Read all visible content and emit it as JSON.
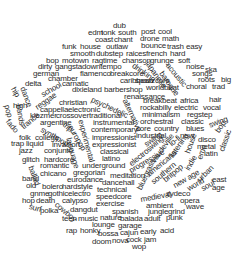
{
  "cloud": {
    "title": "music genre word cloud",
    "words": [
      {
        "t": "dub",
        "x": 113,
        "y": 22,
        "r": 0
      },
      {
        "t": "edm",
        "x": 88,
        "y": 29,
        "r": 0
      },
      {
        "t": "tonk",
        "x": 101,
        "y": 29,
        "r": 0
      },
      {
        "t": "south",
        "x": 118,
        "y": 29,
        "r": 0
      },
      {
        "t": "post",
        "x": 141,
        "y": 28,
        "r": 0
      },
      {
        "t": "cool",
        "x": 158,
        "y": 28,
        "r": 0
      },
      {
        "t": "coast",
        "x": 95,
        "y": 36,
        "r": 0
      },
      {
        "t": "chant",
        "x": 114,
        "y": 36,
        "r": 0
      },
      {
        "t": "drone",
        "x": 140,
        "y": 35,
        "r": 0
      },
      {
        "t": "math",
        "x": 162,
        "y": 35,
        "r": 0
      },
      {
        "t": "funk",
        "x": 62,
        "y": 43,
        "r": 0
      },
      {
        "t": "house",
        "x": 80,
        "y": 43,
        "r": 0
      },
      {
        "t": "outlaw",
        "x": 106,
        "y": 43,
        "r": 0
      },
      {
        "t": "bounce",
        "x": 141,
        "y": 42,
        "r": 0
      },
      {
        "t": "trash",
        "x": 167,
        "y": 43,
        "r": 0
      },
      {
        "t": "easy",
        "x": 186,
        "y": 43,
        "r": 0
      },
      {
        "t": "smooth",
        "x": 70,
        "y": 50,
        "r": 0
      },
      {
        "t": "dubstep",
        "x": 96,
        "y": 50,
        "r": 0
      },
      {
        "t": "raices",
        "x": 126,
        "y": 50,
        "r": 0
      },
      {
        "t": "french",
        "x": 146,
        "y": 50,
        "r": 0
      },
      {
        "t": "hard",
        "x": 170,
        "y": 50,
        "r": 0
      },
      {
        "t": "bop",
        "x": 46,
        "y": 57,
        "r": 0
      },
      {
        "t": "motown",
        "x": 62,
        "y": 57,
        "r": 0
      },
      {
        "t": "ragtime",
        "x": 92,
        "y": 57,
        "r": 0
      },
      {
        "t": "chanson",
        "x": 122,
        "y": 57,
        "r": 0
      },
      {
        "t": "grunge",
        "x": 150,
        "y": 57,
        "r": 0
      },
      {
        "t": "soft",
        "x": 178,
        "y": 57,
        "r": 0
      },
      {
        "t": "dirty",
        "x": 38,
        "y": 63,
        "r": 0
      },
      {
        "t": "gangsta",
        "x": 55,
        "y": 63,
        "r": 0
      },
      {
        "t": "downtempo",
        "x": 82,
        "y": 63,
        "r": 0
      },
      {
        "t": "drinking",
        "x": 135,
        "y": 62,
        "r": 35
      },
      {
        "t": "japanese",
        "x": 150,
        "y": 60,
        "r": 55
      },
      {
        "t": "noise",
        "x": 186,
        "y": 63,
        "r": 0
      },
      {
        "t": "ska",
        "x": 205,
        "y": 66,
        "r": 0
      },
      {
        "t": "german",
        "x": 33,
        "y": 70,
        "r": 0
      },
      {
        "t": "flamenco",
        "x": 80,
        "y": 70,
        "r": 0
      },
      {
        "t": "breakcore",
        "x": 110,
        "y": 70,
        "r": 0
      },
      {
        "t": "acoustic",
        "x": 170,
        "y": 62,
        "r": 50
      },
      {
        "t": "songs",
        "x": 192,
        "y": 70,
        "r": 0
      },
      {
        "t": "chamber",
        "x": 48,
        "y": 75,
        "r": 0
      },
      {
        "t": "caribbean",
        "x": 120,
        "y": 77,
        "r": 0
      },
      {
        "t": "baroque",
        "x": 164,
        "y": 70,
        "r": 55
      },
      {
        "t": "roots",
        "x": 198,
        "y": 76,
        "r": 0
      },
      {
        "t": "big",
        "x": 221,
        "y": 76,
        "r": 0
      },
      {
        "t": "delta",
        "x": 25,
        "y": 80,
        "r": 0
      },
      {
        "t": "carnatic",
        "x": 62,
        "y": 80,
        "r": 0
      },
      {
        "t": "spazzcore",
        "x": 135,
        "y": 77,
        "r": 0
      },
      {
        "t": "school",
        "x": 40,
        "y": 92,
        "r": -30
      },
      {
        "t": "dixieland",
        "x": 72,
        "y": 86,
        "r": 0
      },
      {
        "t": "barbershop",
        "x": 104,
        "y": 86,
        "r": 0
      },
      {
        "t": "worldbeat",
        "x": 146,
        "y": 84,
        "r": 0
      },
      {
        "t": "choral",
        "x": 186,
        "y": 83,
        "r": 0
      },
      {
        "t": "trad",
        "x": 212,
        "y": 83,
        "r": 0
      },
      {
        "t": "renaissance",
        "x": 124,
        "y": 93,
        "r": 0
      },
      {
        "t": "breakbeat",
        "x": 143,
        "y": 97,
        "r": 0
      },
      {
        "t": "africa",
        "x": 180,
        "y": 97,
        "r": 0
      },
      {
        "t": "hair",
        "x": 209,
        "y": 96,
        "r": 0
      },
      {
        "t": "hip",
        "x": 16,
        "y": 86,
        "r": 60
      },
      {
        "t": "dance",
        "x": 26,
        "y": 86,
        "r": 70
      },
      {
        "t": "high",
        "x": 13,
        "y": 102,
        "r": 0
      },
      {
        "t": "reggae",
        "x": 34,
        "y": 105,
        "r": -35
      },
      {
        "t": "christian",
        "x": 59,
        "y": 99,
        "r": 0
      },
      {
        "t": "psychedelic",
        "x": 93,
        "y": 96,
        "r": 25
      },
      {
        "t": "rockabilly",
        "x": 140,
        "y": 104,
        "r": 0
      },
      {
        "t": "electric",
        "x": 174,
        "y": 104,
        "r": 0
      },
      {
        "t": "vocal",
        "x": 203,
        "y": 104,
        "r": 0
      },
      {
        "t": "pop",
        "x": 10,
        "y": 104,
        "r": 75
      },
      {
        "t": "bands",
        "x": 22,
        "y": 104,
        "r": 80
      },
      {
        "t": "cappella",
        "x": 40,
        "y": 106,
        "r": 0
      },
      {
        "t": "electronic",
        "x": 68,
        "y": 106,
        "r": 0
      },
      {
        "t": "alternative",
        "x": 128,
        "y": 98,
        "r": 65
      },
      {
        "t": "minimalism",
        "x": 142,
        "y": 111,
        "r": 0
      },
      {
        "t": "regstep",
        "x": 187,
        "y": 111,
        "r": 0
      },
      {
        "t": "klezmer",
        "x": 30,
        "y": 112,
        "r": 0
      },
      {
        "t": "crossover",
        "x": 56,
        "y": 112,
        "r": 0
      },
      {
        "t": "traditional",
        "x": 89,
        "y": 112,
        "r": 0
      },
      {
        "t": "fado",
        "x": 10,
        "y": 118,
        "r": 50
      },
      {
        "t": "trance",
        "x": 20,
        "y": 125,
        "r": -40
      },
      {
        "t": "argentine",
        "x": 40,
        "y": 119,
        "r": 0
      },
      {
        "t": "instrumental",
        "x": 93,
        "y": 119,
        "r": 0
      },
      {
        "t": "orchestral",
        "x": 140,
        "y": 118,
        "r": 0
      },
      {
        "t": "classic",
        "x": 181,
        "y": 118,
        "r": 0
      },
      {
        "t": "swing",
        "x": 208,
        "y": 122,
        "r": -20
      },
      {
        "t": "synthpop",
        "x": 43,
        "y": 126,
        "r": 30
      },
      {
        "t": "trip",
        "x": 66,
        "y": 121,
        "r": 40
      },
      {
        "t": "contemporary",
        "x": 91,
        "y": 126,
        "r": 0
      },
      {
        "t": "core",
        "x": 136,
        "y": 125,
        "r": 0
      },
      {
        "t": "country",
        "x": 154,
        "y": 125,
        "r": 0
      },
      {
        "t": "blues",
        "x": 186,
        "y": 125,
        "r": 0
      },
      {
        "t": "bop",
        "x": 214,
        "y": 130,
        "r": -55
      },
      {
        "t": "europop",
        "x": 73,
        "y": 124,
        "r": 60
      },
      {
        "t": "experimental",
        "x": 84,
        "y": 119,
        "r": 75
      },
      {
        "t": "impressionist",
        "x": 92,
        "y": 134,
        "r": 0
      },
      {
        "t": "industrial",
        "x": 136,
        "y": 132,
        "r": 0
      },
      {
        "t": "new",
        "x": 180,
        "y": 132,
        "r": 0
      },
      {
        "t": "disco",
        "x": 198,
        "y": 136,
        "r": 0
      },
      {
        "t": "folk",
        "x": 19,
        "y": 134,
        "r": 0
      },
      {
        "t": "college",
        "x": 35,
        "y": 134,
        "r": 0
      },
      {
        "t": "expressionist",
        "x": 92,
        "y": 141,
        "r": 0
      },
      {
        "t": "swing",
        "x": 143,
        "y": 142,
        "r": -35
      },
      {
        "t": "lo-fi",
        "x": 168,
        "y": 142,
        "r": -40
      },
      {
        "t": "metal",
        "x": 197,
        "y": 143,
        "r": 0
      },
      {
        "t": "trap",
        "x": 11,
        "y": 140,
        "r": 0
      },
      {
        "t": "liquid",
        "x": 26,
        "y": 140,
        "r": 0
      },
      {
        "t": "invasion",
        "x": 52,
        "y": 141,
        "r": 0
      },
      {
        "t": "language",
        "x": 72,
        "y": 137,
        "r": 75
      },
      {
        "t": "classical",
        "x": 100,
        "y": 148,
        "r": 0
      },
      {
        "t": "latin",
        "x": 204,
        "y": 150,
        "r": 0
      },
      {
        "t": "jazz",
        "x": 19,
        "y": 147,
        "r": 0
      },
      {
        "t": "conjunto",
        "x": 44,
        "y": 147,
        "r": 0
      },
      {
        "t": "latino",
        "x": 102,
        "y": 155,
        "r": 0
      },
      {
        "t": "electroswing",
        "x": 128,
        "y": 162,
        "r": -40
      },
      {
        "t": "vaudeville",
        "x": 150,
        "y": 160,
        "r": -55
      },
      {
        "t": "listening",
        "x": 168,
        "y": 155,
        "r": -55
      },
      {
        "t": "house",
        "x": 184,
        "y": 152,
        "r": -70
      },
      {
        "t": "emo",
        "x": 196,
        "y": 158,
        "r": -70
      },
      {
        "t": "classic",
        "x": 218,
        "y": 150,
        "r": -70
      },
      {
        "t": "glitch",
        "x": 22,
        "y": 156,
        "r": 0
      },
      {
        "t": "hardcore",
        "x": 44,
        "y": 156,
        "r": 0
      },
      {
        "t": "underground",
        "x": 82,
        "y": 162,
        "r": 0
      },
      {
        "t": "progressive",
        "x": 128,
        "y": 168,
        "r": -30
      },
      {
        "t": "americana",
        "x": 146,
        "y": 172,
        "r": -40
      },
      {
        "t": "indie",
        "x": 184,
        "y": 168,
        "r": -60
      },
      {
        "t": "romantic",
        "x": 40,
        "y": 162,
        "r": 0
      },
      {
        "t": "gregorian",
        "x": 73,
        "y": 169,
        "r": 0
      },
      {
        "t": "meditation",
        "x": 110,
        "y": 172,
        "r": 0
      },
      {
        "t": "southern",
        "x": 150,
        "y": 180,
        "r": -40
      },
      {
        "t": "britpop",
        "x": 162,
        "y": 178,
        "r": -40
      },
      {
        "t": "urban",
        "x": 196,
        "y": 178,
        "r": -45
      },
      {
        "t": "east",
        "x": 212,
        "y": 176,
        "r": 0
      },
      {
        "t": "ballad",
        "x": 34,
        "y": 165,
        "r": 70
      },
      {
        "t": "band",
        "x": 22,
        "y": 175,
        "r": 0
      },
      {
        "t": "chicano",
        "x": 40,
        "y": 170,
        "r": 0
      },
      {
        "t": "eurodance",
        "x": 67,
        "y": 176,
        "r": 0
      },
      {
        "t": "dancehall",
        "x": 102,
        "y": 179,
        "r": 0
      },
      {
        "t": "bluegrass",
        "x": 136,
        "y": 188,
        "r": -65
      },
      {
        "t": "new age",
        "x": 172,
        "y": 183,
        "r": -30
      },
      {
        "t": "world",
        "x": 186,
        "y": 186,
        "r": -30
      },
      {
        "t": "soul",
        "x": 200,
        "y": 186,
        "r": -30
      },
      {
        "t": "age",
        "x": 212,
        "y": 184,
        "r": 0
      },
      {
        "t": "old",
        "x": 26,
        "y": 182,
        "r": 0
      },
      {
        "t": "bolero",
        "x": 42,
        "y": 183,
        "r": 0
      },
      {
        "t": "hardstyle",
        "x": 62,
        "y": 183,
        "r": 0
      },
      {
        "t": "technical",
        "x": 97,
        "y": 186,
        "r": 0
      },
      {
        "t": "gnme",
        "x": 30,
        "y": 190,
        "r": 0
      },
      {
        "t": "gothic",
        "x": 48,
        "y": 190,
        "r": 0
      },
      {
        "t": "electro",
        "x": 68,
        "y": 190,
        "r": 0
      },
      {
        "t": "speedcore",
        "x": 96,
        "y": 193,
        "r": 0
      },
      {
        "t": "medieval",
        "x": 140,
        "y": 196,
        "r": -10
      },
      {
        "t": "zydeco",
        "x": 166,
        "y": 190,
        "r": 0
      },
      {
        "t": "opera",
        "x": 180,
        "y": 197,
        "r": 0
      },
      {
        "t": "hop",
        "x": 22,
        "y": 197,
        "r": 0
      },
      {
        "t": "death",
        "x": 36,
        "y": 197,
        "r": 0
      },
      {
        "t": "calypso",
        "x": 62,
        "y": 197,
        "r": 0
      },
      {
        "t": "exercise",
        "x": 96,
        "y": 200,
        "r": 0
      },
      {
        "t": "ambient",
        "x": 146,
        "y": 202,
        "r": 0
      },
      {
        "t": "wave",
        "x": 186,
        "y": 203,
        "r": 0
      },
      {
        "t": "surf",
        "x": 30,
        "y": 203,
        "r": 15
      },
      {
        "t": "polka",
        "x": 40,
        "y": 207,
        "r": 0
      },
      {
        "t": "cowboy",
        "x": 58,
        "y": 201,
        "r": 40
      },
      {
        "t": "dangdut",
        "x": 70,
        "y": 206,
        "r": 0
      },
      {
        "t": "spanish",
        "x": 112,
        "y": 208,
        "r": 0
      },
      {
        "t": "jungle",
        "x": 148,
        "y": 208,
        "r": 0
      },
      {
        "t": "grind",
        "x": 168,
        "y": 208,
        "r": 0
      },
      {
        "t": "teen",
        "x": 62,
        "y": 215,
        "r": 0
      },
      {
        "t": "music",
        "x": 78,
        "y": 215,
        "r": 0
      },
      {
        "t": "nature",
        "x": 100,
        "y": 214,
        "r": 0
      },
      {
        "t": "balada",
        "x": 120,
        "y": 215,
        "r": 0
      },
      {
        "t": "adult",
        "x": 144,
        "y": 215,
        "r": 0
      },
      {
        "t": "punk",
        "x": 166,
        "y": 214,
        "r": 0
      },
      {
        "t": "lounge",
        "x": 92,
        "y": 221,
        "r": 0
      },
      {
        "t": "garage",
        "x": 118,
        "y": 222,
        "r": 0
      },
      {
        "t": "rap",
        "x": 66,
        "y": 227,
        "r": 0
      },
      {
        "t": "honky",
        "x": 80,
        "y": 227,
        "r": 0
      },
      {
        "t": "bossa",
        "x": 98,
        "y": 230,
        "r": 0
      },
      {
        "t": "cajun",
        "x": 120,
        "y": 229,
        "r": 0
      },
      {
        "t": "early",
        "x": 140,
        "y": 228,
        "r": 0
      },
      {
        "t": "acid",
        "x": 160,
        "y": 227,
        "r": 0
      },
      {
        "t": "cock",
        "x": 126,
        "y": 236,
        "r": 0
      },
      {
        "t": "jam",
        "x": 144,
        "y": 236,
        "r": 0
      },
      {
        "t": "doom",
        "x": 92,
        "y": 238,
        "r": 0
      },
      {
        "t": "nova",
        "x": 112,
        "y": 237,
        "r": 0
      },
      {
        "t": "wop",
        "x": 132,
        "y": 243,
        "r": 0
      }
    ]
  }
}
